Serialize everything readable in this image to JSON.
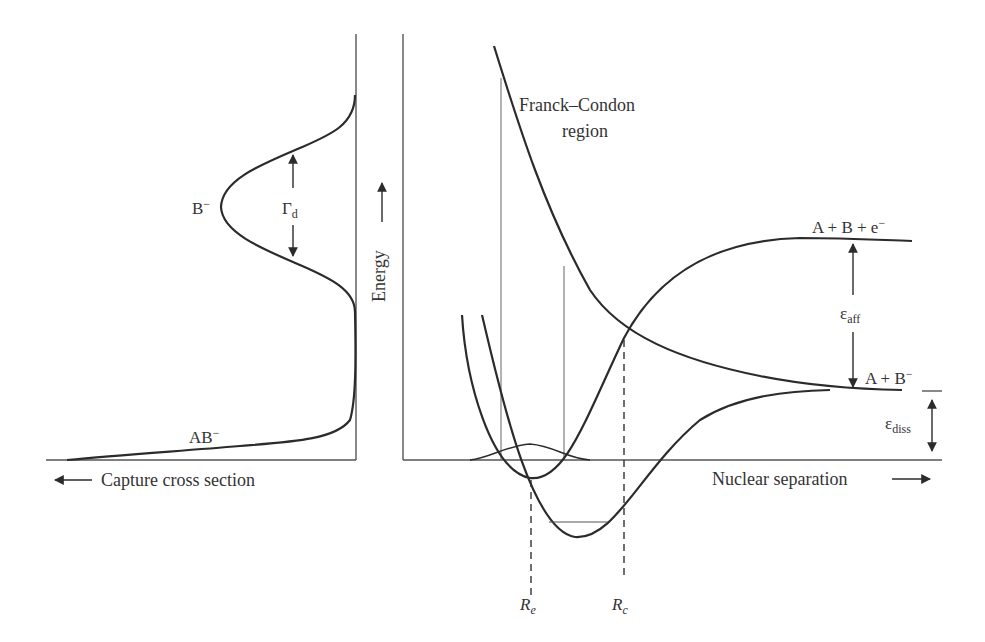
{
  "figure": {
    "left_panel": {
      "axis_label": "Capture cross section",
      "axis_arrow": "left-arrow",
      "curve_labels": {
        "b_minus": {
          "base": "B",
          "sup": "−"
        },
        "ab_minus": {
          "base": "AB",
          "sup": "−"
        }
      },
      "width_label": {
        "base": "Γ",
        "sub": "d"
      }
    },
    "right_panel": {
      "y_axis_label": "Energy",
      "x_axis_label": "Nuclear separation",
      "franck_condon_label": [
        "Franck–Condon",
        "region"
      ],
      "levels": {
        "top": {
          "base": "A + B + e",
          "sup": "−"
        },
        "middle": {
          "base": "A + B",
          "sup": "−"
        }
      },
      "energies": {
        "affinity": {
          "base": "ε",
          "sub": "aff"
        },
        "dissociation": {
          "base": "ε",
          "sub": "diss"
        }
      },
      "markers": {
        "re": {
          "base": "R",
          "sub": "e"
        },
        "rc": {
          "base": "R",
          "sub": "c"
        }
      }
    },
    "colors": {
      "curve": "#2b2b2b",
      "thin_line": "#555555",
      "background": "#ffffff"
    }
  }
}
